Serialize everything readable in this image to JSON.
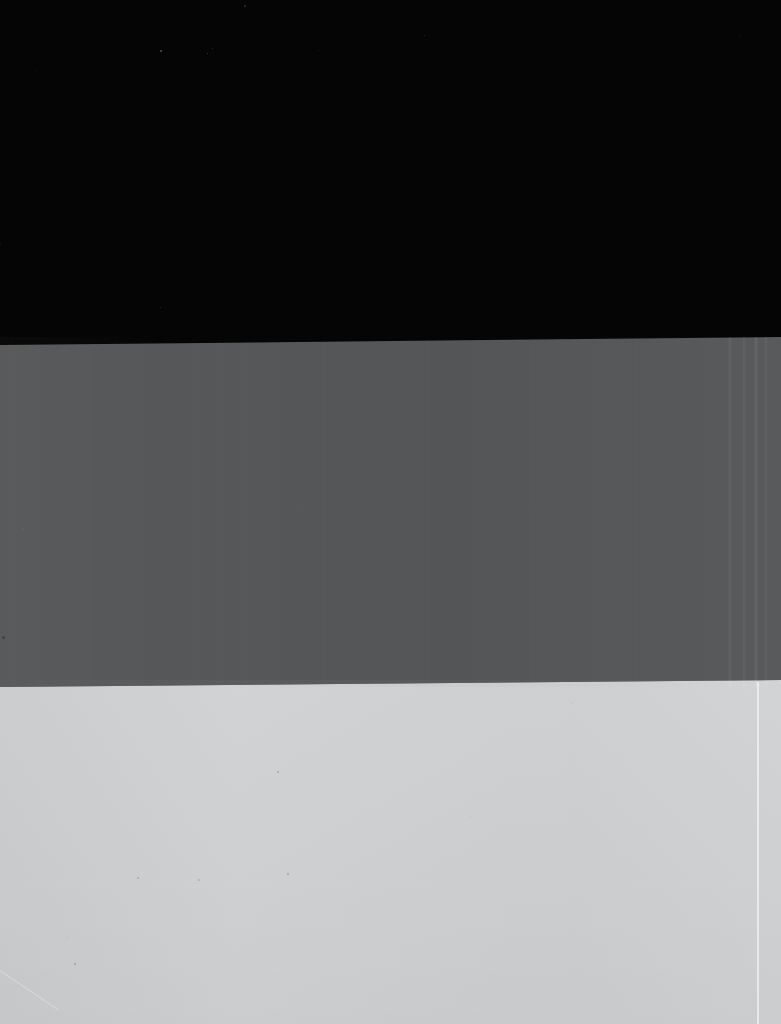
{
  "image": {
    "title": "Three-Band Tonal Test Image",
    "description": "Photographic capture showing three horizontal tonal bands with slightly slanted boundaries",
    "width": 781,
    "height": 1024,
    "medium": "scanned-photograph",
    "content_text": ""
  },
  "bands": [
    {
      "name": "black-band",
      "label": "Black band",
      "color": "#050505",
      "tone": "black",
      "top_left_y": 0,
      "top_right_y": 0,
      "bottom_left_y": 345,
      "bottom_right_y": 337,
      "approx_height": 341
    },
    {
      "name": "mid-gray-band",
      "label": "Mid gray band",
      "color": "#555759",
      "tone": "mid-gray",
      "top_left_y": 345,
      "top_right_y": 337,
      "bottom_left_y": 687,
      "bottom_right_y": 680,
      "approx_height": 342
    },
    {
      "name": "light-gray-band",
      "label": "Light gray band",
      "color": "#cfd1d2",
      "tone": "light-gray",
      "top_left_y": 687,
      "top_right_y": 680,
      "bottom_left_y": 1024,
      "bottom_right_y": 1024,
      "approx_height": 341
    }
  ],
  "boundaries": [
    {
      "name": "black-to-gray-edge",
      "label": "Black / mid-gray boundary",
      "left_y": 345,
      "right_y": 337,
      "slant_px": -8
    },
    {
      "name": "gray-to-light-edge",
      "label": "Mid-gray / light-gray boundary",
      "left_y": 687,
      "right_y": 680,
      "slant_px": -7
    }
  ],
  "artifacts": [
    {
      "name": "vertical-scan-streaks-gray",
      "label": "Vertical scan streaks in mid-gray band",
      "region": "mid-gray-band",
      "intensity": "faint"
    },
    {
      "name": "vertical-scan-streaks-right",
      "label": "Pronounced vertical streaks near right edge",
      "region": "mid-gray-band",
      "x_range": "728-768",
      "intensity": "moderate"
    },
    {
      "name": "bright-hairline",
      "label": "Bright vertical hairline near right edge",
      "region": "light-gray-band",
      "x": 757,
      "intensity": "visible"
    },
    {
      "name": "diagonal-streak",
      "label": "Faint diagonal streak in lower-left corner",
      "region": "light-gray-band",
      "intensity": "faint"
    },
    {
      "name": "sensor-noise-specks",
      "label": "Scattered sensor noise specks",
      "region": "all",
      "intensity": "faint"
    }
  ],
  "specks": [
    {
      "x": 160,
      "y": 50,
      "size": 2,
      "color": "rgba(150,150,150,0.55)"
    },
    {
      "x": 207,
      "y": 53,
      "size": 1,
      "color": "rgba(130,130,130,0.50)"
    },
    {
      "x": 212,
      "y": 48,
      "size": 1,
      "color": "rgba(120,120,120,0.45)"
    },
    {
      "x": 244,
      "y": 5,
      "size": 2,
      "color": "rgba(120,120,120,0.40)"
    },
    {
      "x": 424,
      "y": 35,
      "size": 1,
      "color": "rgba(110,110,110,0.40)"
    },
    {
      "x": 318,
      "y": 50,
      "size": 1,
      "color": "rgba(100,100,100,0.35)"
    },
    {
      "x": 35,
      "y": 70,
      "size": 1,
      "color": "rgba(95,95,95,0.35)"
    },
    {
      "x": 740,
      "y": 35,
      "size": 1,
      "color": "rgba(100,100,100,0.35)"
    },
    {
      "x": 0,
      "y": 243,
      "size": 1,
      "color": "rgba(95,95,95,0.35)"
    },
    {
      "x": 160,
      "y": 307,
      "size": 1,
      "color": "rgba(110,110,110,0.40)"
    },
    {
      "x": 2,
      "y": 636,
      "size": 3,
      "color": "rgba(30,30,30,0.40)"
    },
    {
      "x": 22,
      "y": 528,
      "size": 2,
      "color": "rgba(120,120,120,0.30)"
    },
    {
      "x": 277,
      "y": 771,
      "size": 2,
      "color": "rgba(120,120,120,0.45)"
    },
    {
      "x": 287,
      "y": 873,
      "size": 2,
      "color": "rgba(110,110,110,0.45)"
    },
    {
      "x": 137,
      "y": 877,
      "size": 2,
      "color": "rgba(120,120,120,0.40)"
    },
    {
      "x": 67,
      "y": 937,
      "size": 1,
      "color": "rgba(120,120,120,0.35)"
    },
    {
      "x": 198,
      "y": 879,
      "size": 2,
      "color": "rgba(125,125,125,0.40)"
    },
    {
      "x": 74,
      "y": 963,
      "size": 2,
      "color": "rgba(110,110,110,0.45)"
    },
    {
      "x": 571,
      "y": 703,
      "size": 1,
      "color": "rgba(140,140,140,0.30)"
    },
    {
      "x": 470,
      "y": 816,
      "size": 1,
      "color": "rgba(140,140,140,0.30)"
    }
  ]
}
